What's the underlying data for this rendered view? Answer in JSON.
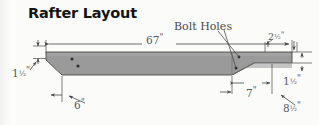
{
  "drawing": {
    "title": "Rafter Layout",
    "type": "technical-dimensioned-elevation",
    "callouts": [
      {
        "id": "bolt-holes",
        "label": "Bolt Holes",
        "points_to": "two small holes near the right-hand bearing area"
      }
    ],
    "dimensions": {
      "overall_length": "67\"",
      "left_end_thickness": "1½\"",
      "left_chamfer_run": "6\"",
      "right_top_offset": "2½\"",
      "right_end_thickness": "1½\"",
      "right_taper_run": "7\"",
      "right_overall": "8½\""
    },
    "dimension_parts": {
      "d67": {
        "whole": "67",
        "frac": "",
        "mark": "\""
      },
      "dL15": {
        "whole": "1",
        "frac": "½",
        "mark": "\""
      },
      "d6": {
        "whole": "6",
        "frac": "",
        "mark": "\""
      },
      "d25": {
        "whole": "2",
        "frac": "½",
        "mark": "\""
      },
      "dR15": {
        "whole": "1",
        "frac": "½",
        "mark": "\""
      },
      "d7": {
        "whole": "7",
        "frac": "",
        "mark": "\""
      },
      "d85": {
        "whole": "8",
        "frac": "½",
        "mark": "\""
      }
    },
    "colors": {
      "background": "#fbfbfa",
      "beam_fill": "#9a9a9a",
      "beam_fill_light": "#a8a8a8",
      "beam_outline": "#4d4d4d",
      "dimension_line": "#4a4a4a",
      "text": "#5a5a5a",
      "title_text": "#141414",
      "bolt_hole": "#2e2e2e"
    },
    "bolt_holes": [
      {
        "cx": 72,
        "cy": 59
      },
      {
        "cx": 78,
        "cy": 66
      },
      {
        "cx": 239,
        "cy": 57
      },
      {
        "cx": 236,
        "cy": 68
      }
    ]
  }
}
